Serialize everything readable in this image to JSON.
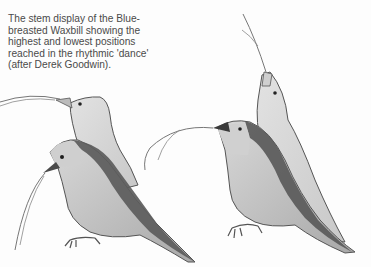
{
  "caption": {
    "lines": [
      "The stem display of the Blue-",
      "breasted Waxbill showing the",
      "highest and lowest positions",
      "reached in the rhythmic 'dance'",
      "(after Derek Goodwin)."
    ]
  },
  "illustration": {
    "subject": "Blue-breasted Waxbill stem display",
    "figures": [
      {
        "name": "left-pair",
        "description": "bird in high and low positions holding grass stem, facing left"
      },
      {
        "name": "right-pair",
        "description": "bird in highest position pointing stem upward, and low position holding stem forward"
      }
    ],
    "colors": {
      "outline": "#555555",
      "light": "#d6d6d6",
      "mid": "#b4b4b4",
      "dark": "#5a5a5a",
      "background": "#fdfdfd"
    }
  }
}
